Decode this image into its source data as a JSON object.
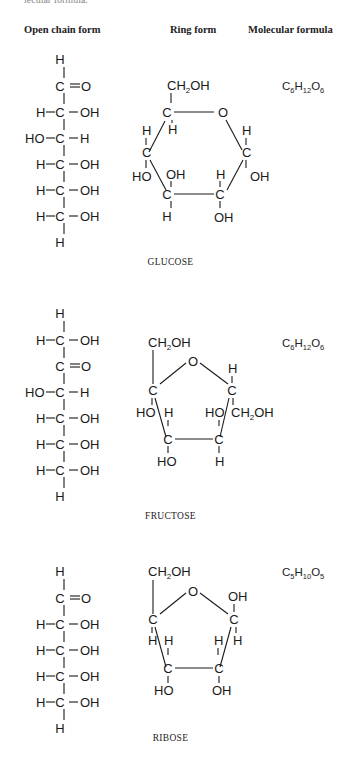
{
  "page": {
    "cutoff_text": "lecular formula."
  },
  "columns": {
    "open_chain": "Open chain form",
    "ring": "Ring form",
    "molecular_formula": "Molecular formula"
  },
  "sugars": [
    {
      "name": "GLUCOSE",
      "formula": {
        "C": "6",
        "H": "12",
        "O": "6"
      },
      "open_chain": [
        "H",
        "C=O",
        "H–C–OH",
        "HO–C–H",
        "H–C–OH",
        "H–C–OH",
        "H–C–OH",
        "H"
      ],
      "ring_type": "pyranose (6-membered)",
      "ring_labels": [
        "CH2OH",
        "O",
        "H",
        "OH",
        "H",
        "OH",
        "H",
        "OH",
        "H",
        "HO",
        "OH",
        "H"
      ]
    },
    {
      "name": "FRUCTOSE",
      "formula": {
        "C": "6",
        "H": "12",
        "O": "6"
      },
      "open_chain": [
        "H",
        "H–C–OH",
        "C=O",
        "HO–C–H",
        "H–C–OH",
        "H–C–OH",
        "H–C–OH",
        "H"
      ],
      "ring_type": "furanose (5-membered)",
      "ring_labels": [
        "CH2OH",
        "O",
        "H",
        "HO",
        "CH2OH",
        "HO",
        "H",
        "HO",
        "H"
      ]
    },
    {
      "name": "RIBOSE",
      "formula": {
        "C": "5",
        "H": "10",
        "O": "5"
      },
      "open_chain": [
        "H",
        "C=O",
        "H–C–OH",
        "H–C–OH",
        "H–C–OH",
        "H–C–OH",
        "H"
      ],
      "ring_type": "furanose (5-membered)",
      "ring_labels": [
        "CH2OH",
        "O",
        "OH",
        "H",
        "H",
        "H",
        "H",
        "HO",
        "OH"
      ]
    }
  ],
  "labels": {
    "C": "C",
    "H": "H",
    "O": "O",
    "OH": "OH",
    "HO": "HO",
    "CH2OH_main": "CH",
    "CH2OH_sub": "2",
    "CH2OH_end": "OH"
  }
}
